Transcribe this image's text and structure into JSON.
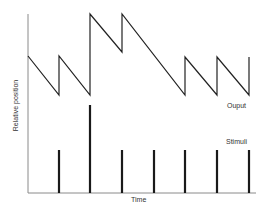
{
  "chart_data": {
    "type": "line",
    "title": "",
    "xlabel": "Time",
    "ylabel": "Relative position",
    "grid": false,
    "legend": "inline labels at right",
    "colors": {
      "axis": "#8a8a8a",
      "line": "#222222",
      "bar": "#1a1a1a"
    },
    "series": [
      {
        "name": "Ouput",
        "kind": "sawtooth",
        "x": [
          0,
          1,
          1,
          2,
          2,
          3,
          3,
          5,
          5,
          6,
          6,
          7,
          7
        ],
        "y": [
          0.57,
          0.33,
          0.57,
          0.33,
          0.83,
          0.6,
          0.83,
          0.33,
          0.57,
          0.33,
          0.57,
          0.33,
          0.57
        ]
      },
      {
        "name": "Stimuli",
        "kind": "impulse",
        "x": [
          1,
          2,
          3,
          4,
          5,
          6,
          7
        ],
        "y": [
          0.24,
          0.49,
          0.24,
          0.24,
          0.24,
          0.24,
          0.24
        ]
      }
    ],
    "xlim": [
      0,
      7.2
    ],
    "ylim": [
      0,
      1
    ]
  },
  "labels": {
    "xlabel": "Time",
    "ylabel": "Relative position",
    "output": "Ouput",
    "stimuli": "Stimuli"
  },
  "geometry": {
    "origin_x": 28,
    "origin_y": 193,
    "axis_top": 14,
    "axis_right": 256,
    "x_unit": 31.57,
    "output_points_px": [
      [
        28,
        56
      ],
      [
        59,
        95
      ],
      [
        59,
        56
      ],
      [
        90,
        95
      ],
      [
        90,
        14
      ],
      [
        122,
        52
      ],
      [
        122,
        14
      ],
      [
        185,
        95
      ],
      [
        185,
        57
      ],
      [
        217,
        95
      ],
      [
        217,
        57
      ],
      [
        249,
        95
      ],
      [
        249,
        57
      ]
    ],
    "stimuli_px": [
      [
        59,
        150
      ],
      [
        90,
        105
      ],
      [
        122,
        150
      ],
      [
        154,
        150
      ],
      [
        185,
        150
      ],
      [
        217,
        150
      ],
      [
        249,
        150
      ]
    ]
  }
}
